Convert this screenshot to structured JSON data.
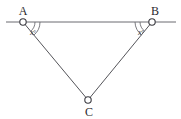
{
  "figure": {
    "type": "geometry-diagram",
    "background_color": "#ffffff",
    "stroke_color": "#55555a",
    "label_color": "#2a2a2e",
    "points": [
      {
        "id": "A",
        "label": "A",
        "x": 23,
        "y": 22,
        "label_x": 23,
        "label_y": 14
      },
      {
        "id": "B",
        "label": "B",
        "x": 152,
        "y": 22,
        "label_x": 154,
        "label_y": 14
      },
      {
        "id": "C",
        "label": "C",
        "x": 88,
        "y": 100,
        "label_x": 88,
        "label_y": 115
      }
    ],
    "lines": [
      {
        "id": "horizontal-transversal",
        "from_x": 6,
        "from_y": 22,
        "to_x": 176,
        "to_y": 22
      },
      {
        "id": "segment-AC",
        "from_x": 23,
        "from_y": 22,
        "to_x": 88,
        "to_y": 100
      },
      {
        "id": "segment-BC",
        "from_x": 152,
        "from_y": 22,
        "to_x": 88,
        "to_y": 100
      }
    ],
    "angles": [
      {
        "id": "angle-at-A",
        "vertex": "A",
        "label": "x",
        "degree_symbol": "°",
        "label_x": 36,
        "label_y": 33,
        "radius": 15
      },
      {
        "id": "angle-at-B",
        "vertex": "B",
        "label": "x",
        "degree_symbol": "°",
        "label_x": 134,
        "label_y": 33,
        "radius": 15
      }
    ]
  }
}
